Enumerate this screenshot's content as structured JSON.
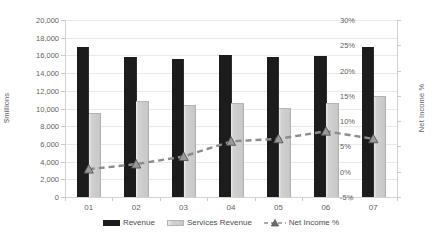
{
  "chart_data": {
    "type": "bar",
    "title": "",
    "categories": [
      "01",
      "02",
      "03",
      "04",
      "05",
      "06",
      "07"
    ],
    "xlabel": "",
    "ylabel": "$millions",
    "ylim": [
      0,
      20000
    ],
    "y2label": "Net Income %",
    "y2lim": [
      -5,
      30
    ],
    "grid": true,
    "legend_position": "bottom",
    "y_ticks": [
      "0",
      "2,000",
      "4,000",
      "6,000",
      "8,000",
      "10,000",
      "12,000",
      "14,000",
      "16,000",
      "18,000",
      "20,000"
    ],
    "y_tick_values": [
      0,
      2000,
      4000,
      6000,
      8000,
      10000,
      12000,
      14000,
      16000,
      18000,
      20000
    ],
    "y2_ticks": [
      "-5%",
      "0%",
      "5%",
      "10%",
      "15%",
      "20%",
      "25%",
      "30%"
    ],
    "y2_tick_values": [
      -5,
      0,
      5,
      10,
      15,
      20,
      25,
      30
    ],
    "series": [
      {
        "name": "Revenue",
        "type": "bar",
        "axis": "left",
        "color": "#1c1c1c",
        "values": [
          17000,
          15800,
          15600,
          16000,
          15800,
          15900,
          17000
        ]
      },
      {
        "name": "Services Revenue",
        "type": "bar",
        "axis": "left",
        "color": "#c7c7c7",
        "values": [
          9400,
          10700,
          10300,
          10500,
          10000,
          10500,
          11300
        ]
      },
      {
        "name": "Net Income %",
        "type": "line",
        "axis": "right",
        "color": "#8c8c8c",
        "marker": "triangle",
        "dashed": true,
        "values": [
          0.5,
          1.5,
          3.0,
          6.0,
          6.5,
          8.0,
          6.5
        ]
      }
    ]
  },
  "legend": {
    "items": [
      {
        "label": "Revenue",
        "swatch": "bar-black-swatch"
      },
      {
        "label": "Services Revenue",
        "swatch": "bar-gray-swatch"
      },
      {
        "label": "Net Income %",
        "swatch": "dashed-line-triangle-swatch"
      }
    ]
  },
  "axes": {
    "left_title": "$millions",
    "right_title": "Net Income %"
  }
}
